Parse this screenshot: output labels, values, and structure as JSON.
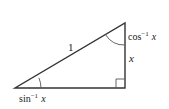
{
  "diagram": {
    "type": "right-triangle",
    "colors": {
      "stroke": "#333333",
      "text": "#1a1a1a",
      "background": "#ffffff"
    },
    "vertices": {
      "bottom_left": [
        15,
        88
      ],
      "bottom_right": [
        125,
        88
      ],
      "top_right": [
        125,
        23
      ]
    },
    "labels": {
      "hypotenuse": "1",
      "vertical_side": "x",
      "top_angle_func": "cos",
      "top_angle_exp": "−1",
      "top_angle_var": "x",
      "bottom_angle_func": "sin",
      "bottom_angle_exp": "−1",
      "bottom_angle_var": "x"
    },
    "right_angle_marker": true
  }
}
